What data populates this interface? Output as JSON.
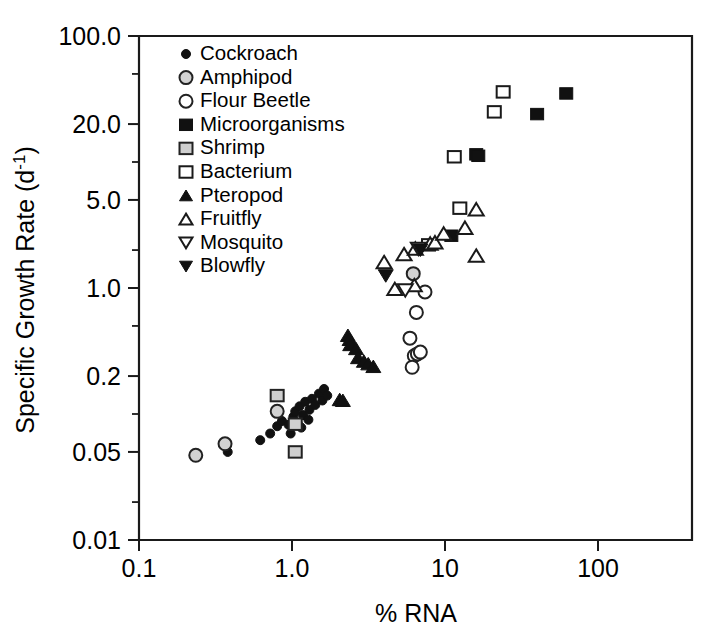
{
  "chart_data": {
    "type": "scatter",
    "title": "",
    "xlabel": "% RNA",
    "ylabel": "Specific Growth Rate (d-1)",
    "ylabel_main": "Specific Growth Rate (d",
    "ylabel_sup": "-1",
    "ylabel_close": ")",
    "xscale": "log",
    "yscale": "log",
    "xlim": [
      0.1,
      200
    ],
    "ylim": [
      0.01,
      100
    ],
    "grid": false,
    "legend_position": "top-left inside axes",
    "xticks": [
      {
        "value": 0.1,
        "label": "0.1"
      },
      {
        "value": 1.0,
        "label": "1.0"
      },
      {
        "value": 10,
        "label": "10"
      },
      {
        "value": 100,
        "label": "100"
      }
    ],
    "yticks": [
      {
        "value": 100.0,
        "label": "100.0"
      },
      {
        "value": 20.0,
        "label": "20.0"
      },
      {
        "value": 5.0,
        "label": "5.0"
      },
      {
        "value": 1.0,
        "label": "1.0"
      },
      {
        "value": 0.2,
        "label": "0.2"
      },
      {
        "value": 0.05,
        "label": "0.05"
      },
      {
        "value": 0.01,
        "label": "0.01"
      }
    ],
    "yminorticks": [
      50.0,
      10.0,
      2.0,
      0.5,
      0.1,
      0.02
    ],
    "series": [
      {
        "name": "Cockroach",
        "marker": "filled-circle",
        "size": 9,
        "fill": "#111111",
        "stroke": "#111111",
        "points": [
          [
            0.38,
            0.05
          ],
          [
            0.62,
            0.062
          ],
          [
            0.72,
            0.07
          ],
          [
            0.8,
            0.08
          ],
          [
            0.86,
            0.088
          ],
          [
            0.95,
            0.082
          ],
          [
            0.98,
            0.07
          ],
          [
            1.02,
            0.095
          ],
          [
            1.05,
            0.105
          ],
          [
            1.1,
            0.082
          ],
          [
            1.12,
            0.115
          ],
          [
            1.18,
            0.098
          ],
          [
            1.22,
            0.125
          ],
          [
            1.3,
            0.108
          ],
          [
            1.35,
            0.132
          ],
          [
            1.42,
            0.118
          ],
          [
            1.5,
            0.145
          ],
          [
            1.58,
            0.128
          ],
          [
            1.62,
            0.158
          ],
          [
            1.7,
            0.14
          ],
          [
            1.15,
            0.078
          ],
          [
            1.28,
            0.09
          ]
        ]
      },
      {
        "name": "Amphipod",
        "marker": "gray-circle",
        "size": 13,
        "fill": "#d2d2d2",
        "stroke": "#222222",
        "points": [
          [
            0.235,
            0.047
          ],
          [
            0.365,
            0.058
          ],
          [
            0.8,
            0.105
          ],
          [
            6.2,
            1.3
          ]
        ]
      },
      {
        "name": "Flour Beetle",
        "marker": "open-circle",
        "size": 13,
        "fill": "#ffffff",
        "stroke": "#222222",
        "points": [
          [
            5.9,
            0.4
          ],
          [
            6.3,
            0.29
          ],
          [
            6.6,
            0.3
          ],
          [
            6.9,
            0.31
          ],
          [
            6.1,
            0.235
          ],
          [
            6.5,
            0.64
          ],
          [
            7.4,
            0.93
          ]
        ]
      },
      {
        "name": "Microorganisms",
        "marker": "filled-square",
        "size": 13,
        "fill": "#111111",
        "stroke": "#111111",
        "points": [
          [
            16.0,
            11.5
          ],
          [
            16.5,
            11.2
          ],
          [
            40.0,
            24.0
          ],
          [
            62.0,
            35.0
          ],
          [
            11.0,
            2.6
          ]
        ]
      },
      {
        "name": "Shrimp",
        "marker": "gray-square",
        "size": 13,
        "fill": "#cfcfcf",
        "stroke": "#222222",
        "points": [
          [
            0.8,
            0.14
          ],
          [
            1.05,
            0.083
          ],
          [
            1.05,
            0.05
          ]
        ]
      },
      {
        "name": "Bacterium",
        "marker": "open-square",
        "size": 13,
        "fill": "#ffffff",
        "stroke": "#1a1a1a",
        "points": [
          [
            24.0,
            36.0
          ],
          [
            21.0,
            25.0
          ],
          [
            11.5,
            11.0
          ],
          [
            12.5,
            4.3
          ],
          [
            7.8,
            2.2
          ]
        ]
      },
      {
        "name": "Pteropod",
        "marker": "filled-triangle",
        "size": 15,
        "fill": "#111111",
        "stroke": "#111111",
        "points": [
          [
            2.32,
            0.42
          ],
          [
            2.38,
            0.39
          ],
          [
            2.4,
            0.355
          ],
          [
            2.62,
            0.33
          ],
          [
            2.7,
            0.28
          ],
          [
            2.95,
            0.262
          ],
          [
            3.15,
            0.25
          ],
          [
            3.4,
            0.238
          ],
          [
            2.05,
            0.13
          ],
          [
            2.15,
            0.128
          ]
        ]
      },
      {
        "name": "Fruitfly",
        "marker": "open-triangle",
        "size": 15,
        "fill": "#ffffff",
        "stroke": "#1a1a1a",
        "points": [
          [
            4.0,
            1.6
          ],
          [
            5.4,
            1.85
          ],
          [
            6.4,
            2.05
          ],
          [
            8.0,
            2.25
          ],
          [
            8.6,
            2.3
          ],
          [
            9.8,
            2.7
          ],
          [
            13.5,
            3.0
          ],
          [
            16.0,
            4.2
          ],
          [
            16.0,
            1.8
          ],
          [
            4.7,
            0.98
          ],
          [
            6.3,
            1.05
          ]
        ]
      },
      {
        "name": "Mosquito",
        "marker": "open-down-triangle",
        "size": 15,
        "fill": "#ffffff",
        "stroke": "#1a1a1a",
        "points": [
          [
            6.7,
            2.05
          ],
          [
            5.5,
            0.96
          ]
        ]
      },
      {
        "name": "Blowfly",
        "marker": "filled-down-triangle",
        "size": 15,
        "fill": "#111111",
        "stroke": "#111111",
        "points": [
          [
            4.1,
            1.25
          ],
          [
            6.9,
            2.0
          ]
        ]
      }
    ]
  },
  "legend": {
    "items": [
      {
        "label": "Cockroach",
        "marker": "filled-circle"
      },
      {
        "label": "Amphipod",
        "marker": "gray-circle"
      },
      {
        "label": "Flour Beetle",
        "marker": "open-circle"
      },
      {
        "label": "Microorganisms",
        "marker": "filled-square"
      },
      {
        "label": "Shrimp",
        "marker": "gray-square"
      },
      {
        "label": "Bacterium",
        "marker": "open-square"
      },
      {
        "label": "Pteropod",
        "marker": "filled-triangle"
      },
      {
        "label": "Fruitfly",
        "marker": "open-triangle"
      },
      {
        "label": "Mosquito",
        "marker": "open-down-triangle"
      },
      {
        "label": "Blowfly",
        "marker": "filled-down-triangle"
      }
    ]
  },
  "colors": {
    "axis": "#1a1a1a",
    "text": "#000000",
    "filled": "#111111",
    "gray_fill": "#d0d0d0",
    "open_fill": "#ffffff",
    "background": "#ffffff"
  }
}
